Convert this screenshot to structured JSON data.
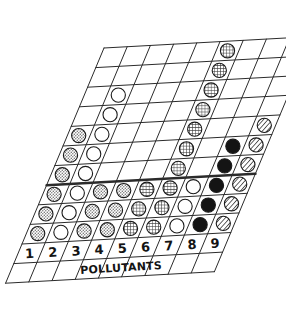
{
  "figure": {
    "title": "",
    "caption_label": "POLLUTANTS",
    "style": "hand-drawn skewed grid pictogram"
  },
  "axis": {
    "column_labels": [
      "1",
      "2",
      "3",
      "4",
      "5",
      "6",
      "7",
      "8",
      "9"
    ],
    "x_title": "POLLUTANTS",
    "row_count": 10,
    "column_count": 9
  },
  "legend_patterns": {
    "open": "open-circle",
    "stipple": "stipple-filled-circle",
    "mesh": "mesh-filled-circle",
    "solid": "solid-black-circle",
    "hatch": "diagonal-hatch-circle"
  },
  "colors": {
    "ink": "#2b2b2b",
    "paper": "#ffffff",
    "solid_fill": "#141414",
    "stipple_fill": "#9a9a9a",
    "mesh_fill": "#6e6e6e",
    "hatch_fill": "#8a8a8a"
  },
  "chart_data": {
    "type": "bar",
    "title": "",
    "xlabel": "POLLUTANTS",
    "ylabel": "",
    "categories": [
      "1",
      "2",
      "3",
      "4",
      "5",
      "6",
      "7",
      "8",
      "9"
    ],
    "values": [
      6,
      7,
      4,
      4,
      3,
      10,
      3,
      5,
      6
    ],
    "ylim": [
      0,
      10
    ],
    "grid": true,
    "legend": "none",
    "note": "Stacked unit pictogram: each column is a stack of marked cells counted from the baseline row upward on a sheared grid.",
    "marker_by_column": {
      "1": "stipple",
      "2": "open",
      "3": "stipple",
      "4": "stipple",
      "5": "mesh",
      "6": "mesh",
      "7": "open",
      "8": "solid",
      "9": "hatch"
    },
    "cells": [
      {
        "column": 1,
        "rows_marked": [
          5,
          6,
          7,
          8,
          9,
          10
        ],
        "marker": "stipple"
      },
      {
        "column": 2,
        "rows_marked": [
          3,
          4,
          5,
          6,
          7,
          8,
          9,
          10
        ],
        "marker": "open"
      },
      {
        "column": 3,
        "rows_marked": [
          8,
          9,
          10
        ],
        "marker": "stipple"
      },
      {
        "column": 4,
        "rows_marked": [
          8,
          9,
          10
        ],
        "marker": "stipple"
      },
      {
        "column": 5,
        "rows_marked": [
          8,
          9,
          10
        ],
        "marker": "mesh"
      },
      {
        "column": 6,
        "rows_marked": [
          1,
          2,
          3,
          4,
          5,
          6,
          7,
          8,
          9,
          10
        ],
        "marker": "mesh"
      },
      {
        "column": 7,
        "rows_marked": [
          8,
          9,
          10
        ],
        "marker": "open"
      },
      {
        "column": 8,
        "rows_marked": [
          6,
          7,
          8,
          9,
          10
        ],
        "marker": "solid"
      },
      {
        "column": 9,
        "rows_marked": [
          5,
          6,
          7,
          8,
          9,
          10
        ],
        "marker": "hatch"
      }
    ]
  }
}
